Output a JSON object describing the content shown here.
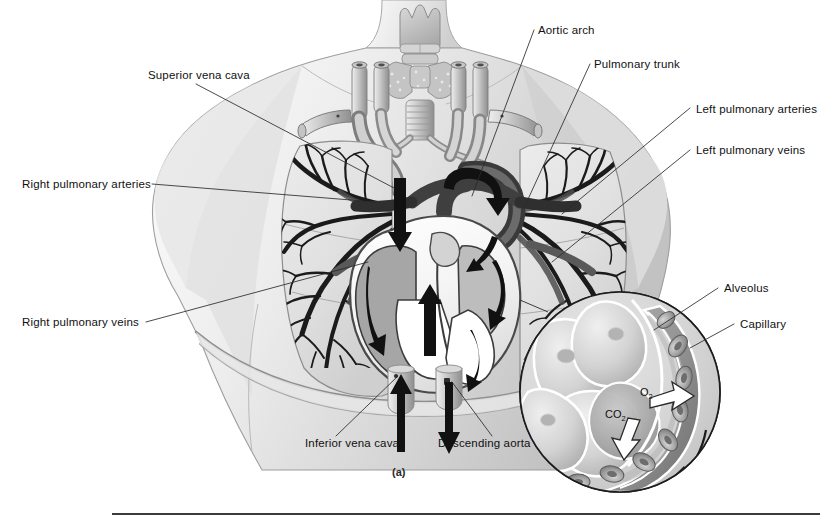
{
  "figure": {
    "caption": "(a)",
    "panel_letter": "(a)",
    "background_color": "#ffffff",
    "ink_color": "#111111",
    "leader_line_color": "#3a3a3a"
  },
  "labels": {
    "superior_vena_cava": "Superior vena cava",
    "right_pulmonary_arteries": "Right pulmonary arteries",
    "right_pulmonary_veins": "Right pulmonary veins",
    "inferior_vena_cava": "Inferior vena cava",
    "descending_aorta": "Descending aorta",
    "aortic_arch": "Aortic arch",
    "pulmonary_trunk": "Pulmonary trunk",
    "left_pulmonary_arteries": "Left pulmonary arteries",
    "left_pulmonary_veins": "Left pulmonary veins",
    "alveolus": "Alveolus",
    "capillary": "Capillary"
  },
  "inset": {
    "oxygen": "O",
    "oxygen_sub": "2",
    "carbon_dioxide": "CO",
    "carbon_dioxide_sub": "2",
    "title": "Alveolus and capillary gas exchange"
  },
  "palette": {
    "skin_light": "#f2f2f2",
    "skin_mid": "#d9d9d9",
    "skin_shadow": "#bdbdbd",
    "lung_fill": "#e3e3e3",
    "lung_edge": "#8d8d8d",
    "vessel_light": "#dcdcdc",
    "vessel_mid": "#a8a8a8",
    "vessel_dark": "#4a4a4a",
    "bronchi_dark": "#1f1f1f",
    "heart_white": "#fbfbfb",
    "heart_gray": "#9d9d9d",
    "arrow_black": "#111111",
    "alveoli_fill": "#cfcfcf",
    "rbc_gray": "#8f8f8f",
    "divider": "#3b3b3b"
  }
}
